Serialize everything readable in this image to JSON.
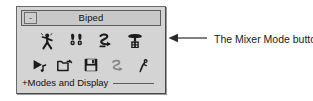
{
  "panel": {
    "title": "Biped",
    "minimize_label": "-",
    "background_color": "#d4d4d4",
    "border_color": "#6a6a6a",
    "titlebar_color": "#c8c8c8"
  },
  "mode_buttons": [
    {
      "name": "figure-mode",
      "icon": "walking-figure-icon",
      "state": "enabled"
    },
    {
      "name": "footstep-mode",
      "icon": "footprints-icon",
      "state": "enabled"
    },
    {
      "name": "motion-flow-mode",
      "icon": "motion-flow-icon",
      "state": "enabled"
    },
    {
      "name": "mixer-mode",
      "icon": "mixer-icon",
      "state": "enabled"
    }
  ],
  "file_buttons": [
    {
      "name": "load-motion",
      "icon": "play-track-icon",
      "state": "enabled"
    },
    {
      "name": "open-file",
      "icon": "open-folder-icon",
      "state": "enabled"
    },
    {
      "name": "save-file",
      "icon": "floppy-disk-icon",
      "state": "enabled"
    },
    {
      "name": "loop-cycle",
      "icon": "loop-cycle-icon",
      "state": "disabled"
    },
    {
      "name": "pose-figure",
      "icon": "pose-figure-icon",
      "state": "enabled"
    }
  ],
  "rollout": {
    "label": "+Modes and Display"
  },
  "callout": {
    "text": "The Mixer Mode button",
    "arrow_direction": "left",
    "line_color": "#2a2a2a"
  }
}
